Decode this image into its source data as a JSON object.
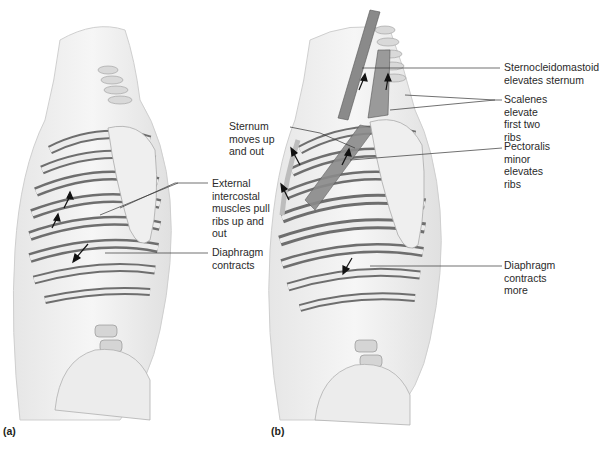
{
  "figure": {
    "panels": [
      {
        "id": "a",
        "label": "(a)",
        "annotations": [
          {
            "text": "External\nintercostal\nmuscles pull\nribs up and out"
          },
          {
            "text": "Diaphragm\ncontracts"
          }
        ]
      },
      {
        "id": "b",
        "label": "(b)",
        "annotations": [
          {
            "text": "Sternocleidomastoid\nelevates sternum"
          },
          {
            "text": "Scalenes elevate\nfirst two ribs"
          },
          {
            "text": "Sternum\nmoves up\nand out"
          },
          {
            "text": "Pectoralis minor\nelevates ribs"
          },
          {
            "text": "Diaphragm\ncontracts more"
          }
        ]
      }
    ]
  },
  "colors": {
    "rib": "#e8e8e8",
    "muscle": "#7a7a7a",
    "skin": "#f2f2f2",
    "leader": "#333333"
  }
}
